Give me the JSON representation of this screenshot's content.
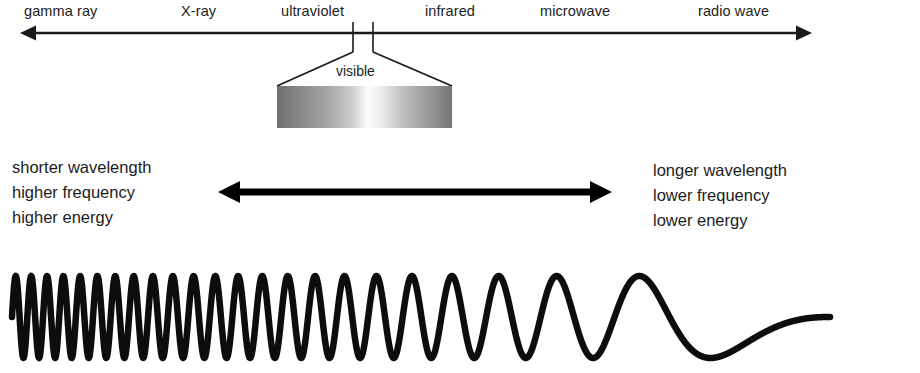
{
  "diagram": {
    "background_color": "#ffffff",
    "line_color": "#1a1a1a",
    "text_color": "#1c1c1c"
  },
  "spectrum_axis": {
    "name": "electromagnetic-spectrum-axis",
    "arrow_style": "double-headed",
    "x_start": 20,
    "x_end": 812,
    "y": 33,
    "bands": [
      {
        "label": "gamma ray",
        "x": 24,
        "order": 1
      },
      {
        "label": "X-ray",
        "x": 181,
        "order": 2
      },
      {
        "label": "ultraviolet",
        "x": 281,
        "order": 3
      },
      {
        "label": "infrared",
        "x": 425,
        "order": 4
      },
      {
        "label": "microwave",
        "x": 540,
        "order": 5
      },
      {
        "label": "radio wave",
        "x": 698,
        "order": 6
      }
    ]
  },
  "visible_callout": {
    "label": "visible",
    "tick_left_x": 353,
    "tick_right_x": 373,
    "tick_top_y": 22,
    "tick_bottom_y": 52,
    "bar": {
      "x": 277,
      "y": 86,
      "width": 175,
      "height": 42,
      "gradient_description": "grayscale violet-to-red rendered in shades of gray: dark edges, bright center",
      "gradient_stops": [
        {
          "offset": "0%",
          "color": "#6e6e6e"
        },
        {
          "offset": "14%",
          "color": "#8a8a8a"
        },
        {
          "offset": "30%",
          "color": "#a8a8a8"
        },
        {
          "offset": "44%",
          "color": "#d2d2d2"
        },
        {
          "offset": "52%",
          "color": "#fdfdfd"
        },
        {
          "offset": "60%",
          "color": "#eaeaea"
        },
        {
          "offset": "72%",
          "color": "#bfbfbf"
        },
        {
          "offset": "86%",
          "color": "#9a9a9a"
        },
        {
          "offset": "100%",
          "color": "#757575"
        }
      ]
    }
  },
  "comparison": {
    "short_side": {
      "name": "shorter-wavelength-block",
      "lines": [
        "shorter wavelength",
        "higher frequency",
        "higher energy"
      ]
    },
    "long_side": {
      "name": "longer-wavelength-block",
      "lines": [
        "longer wavelength",
        "lower frequency",
        "lower energy"
      ]
    },
    "arrow": {
      "name": "wavelength-direction-arrow",
      "style": "double-headed-thick",
      "x_start": 218,
      "x_end": 612,
      "y": 192,
      "thickness": 7,
      "head_length": 22,
      "head_half_height": 11
    }
  },
  "wave": {
    "name": "chirped-sine-wave",
    "description": "sine wave whose wavelength increases from left (short) to right (long)",
    "x_start": 12,
    "x_end": 830,
    "baseline_y": 317,
    "amplitude": 41,
    "stroke_width": 6.5,
    "cycles_total": 23,
    "chirp_exponent": 2.35
  }
}
